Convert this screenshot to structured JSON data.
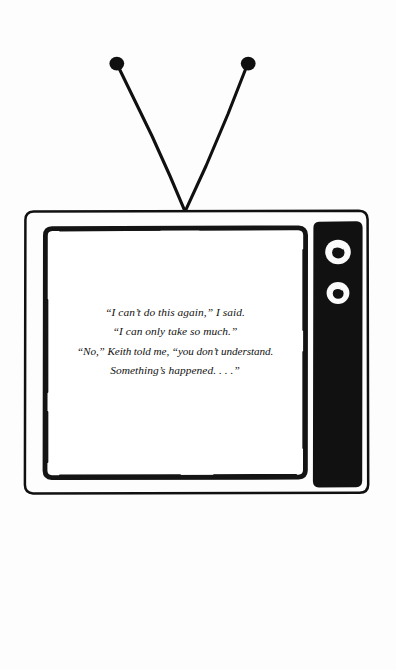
{
  "page": {
    "kind": "book-illustration",
    "background_color": "#fdfdfd",
    "ink_color": "#101010"
  },
  "illustration": {
    "subject": "television-set",
    "style": "hand-drawn ink line art",
    "antenna": {
      "name": "rabbit-ear-antenna",
      "left_tip": {
        "x": 117,
        "y": 64
      },
      "right_tip": {
        "x": 248,
        "y": 64
      },
      "vertex": {
        "x": 185,
        "y": 211
      },
      "knob_radius": 7
    },
    "cabinet": {
      "name": "tv-cabinet",
      "x": 25,
      "y": 211,
      "width": 343,
      "height": 282,
      "stroke_width": 2.4
    },
    "screen": {
      "name": "tv-screen",
      "x": 45,
      "y": 228,
      "width": 260,
      "height": 249,
      "stroke_width": 4.6,
      "fill": "#ffffff"
    },
    "control_panel": {
      "name": "tv-control-panel",
      "x": 313,
      "y": 222,
      "width": 49,
      "height": 265,
      "fill": "#111111",
      "dials": [
        {
          "name": "channel-dial",
          "cx": 338,
          "cy": 252,
          "outer_r": 12.5,
          "inner_r": 6.0
        },
        {
          "name": "tuning-dial",
          "cx": 338,
          "cy": 293,
          "outer_r": 11.0,
          "inner_r": 5.2
        }
      ]
    }
  },
  "screen_text": {
    "alignment": "center",
    "style": "italic",
    "lines": [
      "“I can’t do this again,” I said.",
      "“I can only take so much.”",
      "“No,” Keith told me, “you don’t understand.",
      "Something’s happened. . . .”"
    ]
  }
}
